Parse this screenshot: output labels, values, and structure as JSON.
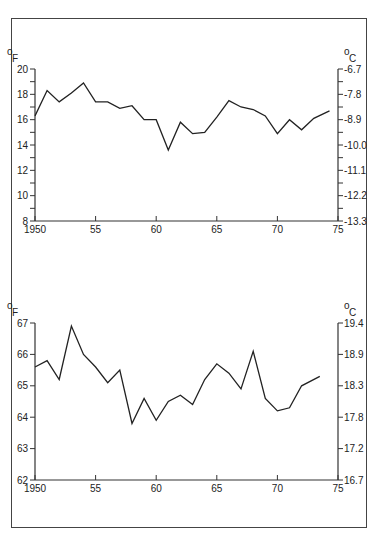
{
  "chart_data": [
    {
      "type": "line",
      "title": "",
      "xlabel": "",
      "ylabel": "°F",
      "ylabel_right": "°C",
      "xlim": [
        1950,
        1975
      ],
      "ylim": [
        8,
        20
      ],
      "x_ticks": [
        "1950",
        "55",
        "60",
        "65",
        "70",
        "75"
      ],
      "y_ticks_left": [
        "8",
        "10",
        "12",
        "14",
        "16",
        "18",
        "20"
      ],
      "y_ticks_right": [
        "-13.3",
        "-12.2",
        "-11.1",
        "-10.0",
        "-8.9",
        "-7.8",
        "-6.7"
      ],
      "grid": false,
      "series": [
        {
          "name": "Temperature (top panel)",
          "x": [
            1950,
            1951,
            1952,
            1953,
            1954,
            1955,
            1956,
            1957,
            1958,
            1959,
            1960,
            1961,
            1962,
            1963,
            1964,
            1965,
            1966,
            1967,
            1968,
            1969,
            1970,
            1971,
            1972,
            1973,
            1974.3
          ],
          "values": [
            16.3,
            18.3,
            17.4,
            18.1,
            18.9,
            17.4,
            17.4,
            16.9,
            17.1,
            16.0,
            16.0,
            13.6,
            15.8,
            14.9,
            15.0,
            16.2,
            17.5,
            17.0,
            16.8,
            16.3,
            14.9,
            16.0,
            15.2,
            16.1,
            16.7
          ]
        }
      ]
    },
    {
      "type": "line",
      "title": "",
      "xlabel": "",
      "ylabel": "°F",
      "ylabel_right": "°C",
      "xlim": [
        1950,
        1975
      ],
      "ylim": [
        62,
        67
      ],
      "x_ticks": [
        "1950",
        "55",
        "60",
        "65",
        "70",
        "75"
      ],
      "y_ticks_left": [
        "62",
        "63",
        "64",
        "65",
        "66",
        "67"
      ],
      "y_ticks_right": [
        "16.7",
        "17.2",
        "17.8",
        "18.3",
        "18.9",
        "19.4"
      ],
      "grid": false,
      "series": [
        {
          "name": "Temperature (bottom panel)",
          "x": [
            1950,
            1951,
            1952,
            1953,
            1954,
            1955,
            1956,
            1957,
            1958,
            1959,
            1960,
            1961,
            1962,
            1963,
            1964,
            1965,
            1966,
            1967,
            1968,
            1969,
            1970,
            1971,
            1972,
            1973.5
          ],
          "values": [
            65.6,
            65.8,
            65.2,
            66.9,
            66.0,
            65.6,
            65.1,
            65.5,
            63.8,
            64.6,
            63.9,
            64.5,
            64.7,
            64.4,
            65.2,
            65.7,
            65.4,
            64.9,
            66.1,
            64.6,
            64.2,
            64.3,
            65.0,
            65.3
          ]
        }
      ]
    }
  ],
  "labels": {
    "unit_f": "o",
    "unit_f_letter": "F",
    "unit_c": "o",
    "unit_c_letter": "C"
  },
  "colors": {
    "line": "#222222",
    "axis": "#333333",
    "frame": "#444444"
  }
}
